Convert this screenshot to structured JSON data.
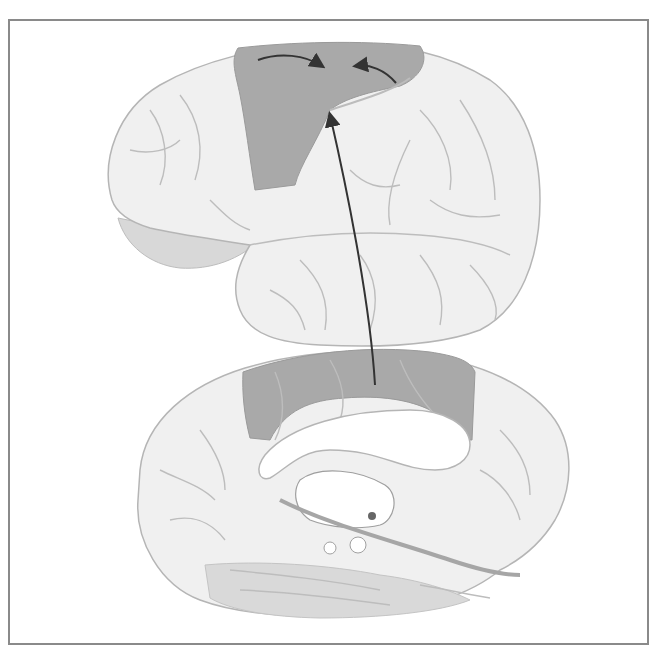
{
  "figure": {
    "type": "anatomical-illustration",
    "views": [
      {
        "id": "lateral",
        "label": "",
        "highlighted_region": "premotor/motor strip (frontal-parietal)"
      },
      {
        "id": "medial",
        "label": "",
        "highlighted_region": "medial frontal/parietal cortex band"
      }
    ],
    "arrows": [
      {
        "id": "arrow-left-to-center",
        "view": "lateral"
      },
      {
        "id": "arrow-right-to-center",
        "view": "lateral"
      },
      {
        "id": "arrow-medial-to-lateral",
        "from": "medial",
        "to": "lateral"
      }
    ],
    "colors": {
      "frame": "#8a8a8a",
      "cortex_fill": "#f0f0f0",
      "sulcus_line": "#b5b5b5",
      "highlight_dark": "#a8a8a8",
      "highlight_light": "#d4d4d4",
      "arrow": "#333333",
      "background": "#ffffff"
    }
  }
}
